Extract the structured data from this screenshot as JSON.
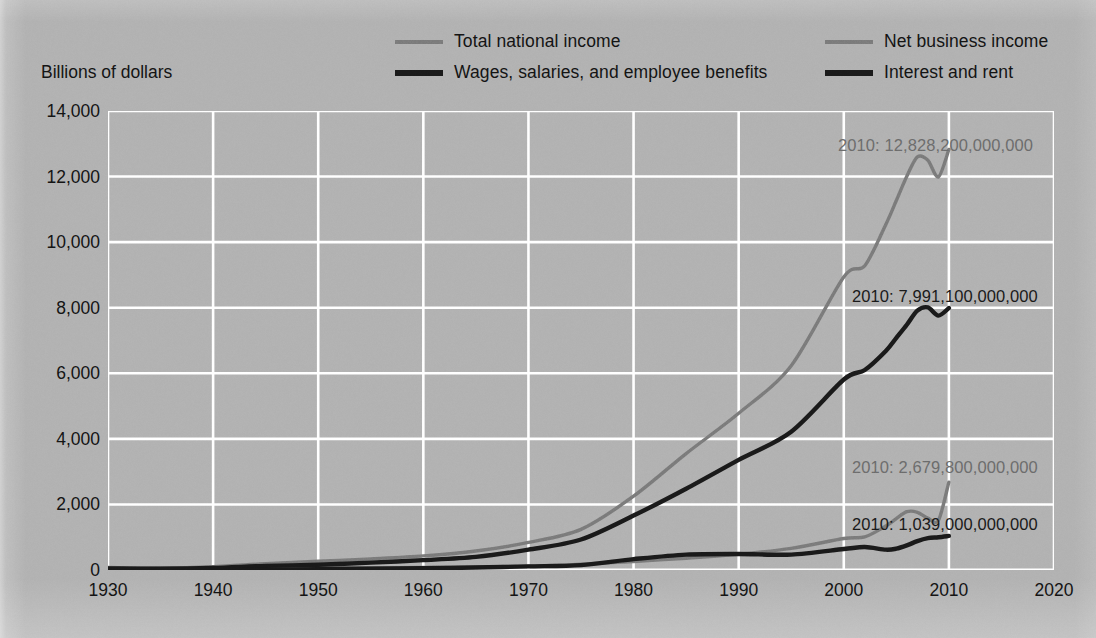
{
  "figure": {
    "y_axis_title": "Billions of dollars",
    "background_color": "#b3b3b3",
    "grid_color": "#ffffff",
    "series_color_gray": "#7d7d7d",
    "series_color_black": "#1a1a1a",
    "annotation_color_gray": "#6e6e6e",
    "annotation_color_black": "#1a1a1a"
  },
  "legend": {
    "items": [
      {
        "label": "Total national income",
        "icon": "line-swatch-gray",
        "color": "#7d7d7d",
        "weight": "thin"
      },
      {
        "label": "Net business income",
        "icon": "line-swatch-gray",
        "color": "#7d7d7d",
        "weight": "thin"
      },
      {
        "label": "Wages, salaries, and employee benefits",
        "icon": "line-swatch-black",
        "color": "#1a1a1a",
        "weight": "thick"
      },
      {
        "label": "Interest and rent",
        "icon": "line-swatch-black",
        "color": "#1a1a1a",
        "weight": "thick"
      }
    ]
  },
  "annotations": [
    {
      "text": "2010: 12,828,200,000,000",
      "series": "Total national income",
      "color": "#6e6e6e",
      "left": 838,
      "top": 136
    },
    {
      "text": "2010: 7,991,100,000,000",
      "series": "Wages, salaries, and employee benefits",
      "color": "#1a1a1a",
      "left": 852,
      "top": 287
    },
    {
      "text": "2010: 2,679,800,000,000",
      "series": "Net business income",
      "color": "#6e6e6e",
      "left": 852,
      "top": 458
    },
    {
      "text": "2010: 1,039,000,000,000",
      "series": "Interest and rent",
      "color": "#1a1a1a",
      "left": 852,
      "top": 515
    }
  ],
  "chart_data": {
    "type": "line",
    "title": "",
    "subtitle": "",
    "xlabel": "",
    "ylabel": "Billions of dollars",
    "xlim": [
      1930,
      2020
    ],
    "ylim": [
      0,
      14000
    ],
    "xticks": [
      1930,
      1940,
      1950,
      1960,
      1970,
      1980,
      1990,
      2000,
      2010,
      2020
    ],
    "yticks": [
      0,
      2000,
      4000,
      6000,
      8000,
      10000,
      12000,
      14000
    ],
    "ytick_labels": [
      "0",
      "2,000",
      "4,000",
      "6,000",
      "8,000",
      "10,000",
      "12,000",
      "14,000"
    ],
    "xtick_labels": [
      "1930",
      "1940",
      "1950",
      "1960",
      "1970",
      "1980",
      "1990",
      "2000",
      "2010",
      "2020"
    ],
    "grid": true,
    "grid_axis": "both",
    "legend_position": "above-plot",
    "units": "billions of dollars",
    "x": [
      1930,
      1935,
      1940,
      1945,
      1950,
      1955,
      1960,
      1965,
      1970,
      1975,
      1980,
      1985,
      1990,
      1995,
      2000,
      2002,
      2004,
      2005,
      2006,
      2007,
      2008,
      2009,
      2010
    ],
    "series": [
      {
        "name": "Total national income",
        "color": "#7d7d7d",
        "final_value_2010": 12828.2,
        "values": [
          75,
          60,
          100,
          190,
          265,
          340,
          430,
          580,
          840,
          1240,
          2250,
          3550,
          4780,
          6230,
          8940,
          9280,
          10540,
          11270,
          12010,
          12600,
          12500,
          11990,
          12828
        ]
      },
      {
        "name": "Wages, salaries, and employee benefits",
        "color": "#1a1a1a",
        "final_value_2010": 7991.1,
        "values": [
          50,
          40,
          65,
          125,
          160,
          225,
          300,
          400,
          620,
          930,
          1660,
          2480,
          3360,
          4220,
          5810,
          6100,
          6680,
          7080,
          7480,
          7910,
          8010,
          7760,
          7991
        ]
      },
      {
        "name": "Net business income",
        "color": "#7d7d7d",
        "final_value_2010": 2679.8,
        "values": [
          15,
          12,
          22,
          45,
          64,
          70,
          78,
          94,
          118,
          180,
          260,
          360,
          480,
          660,
          960,
          1010,
          1340,
          1570,
          1780,
          1760,
          1580,
          1510,
          2680
        ]
      },
      {
        "name": "Interest and rent",
        "color": "#1a1a1a",
        "final_value_2010": 1039.0,
        "values": [
          10,
          8,
          10,
          16,
          26,
          38,
          52,
          74,
          110,
          150,
          330,
          470,
          490,
          470,
          640,
          700,
          620,
          650,
          750,
          880,
          970,
          1000,
          1039
        ]
      }
    ]
  }
}
